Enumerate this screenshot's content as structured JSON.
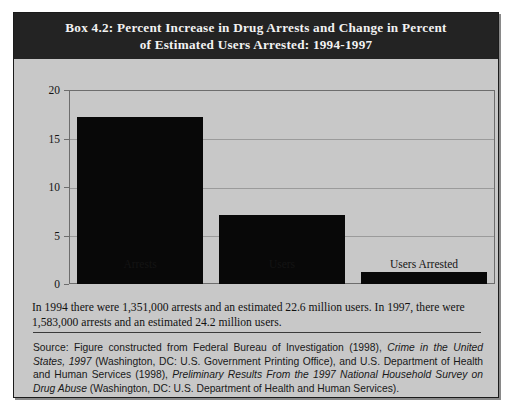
{
  "box": {
    "title_line1": "Box 4.2: Percent Increase in Drug Arrests and Change in Percent",
    "title_line2": "of Estimated Users Arrested: 1994-1997",
    "note": "In 1994 there were 1,351,000 arrests and an estimated 22.6 million users. In 1997, there were 1,583,000 arrests and an estimated 24.2 million users.",
    "source_prefix": "Source: Figure constructed from Federal Bureau of Investigation (1998), ",
    "source_title1": "Crime in the United States, 1997",
    "source_mid": " (Washington, DC: U.S. Government Printing Office), and U.S. Department of Health and Human Services (1998), ",
    "source_title2": "Preliminary Results From the 1997 National Household Survey on Drug Abuse",
    "source_suffix": " (Washington, DC: U.S. Department of Health and Human Services)."
  },
  "chart_data": {
    "type": "bar",
    "title": "Box 4.2: Percent Increase in Drug Arrests and Change in Percent of Estimated Users Arrested: 1994-1997",
    "categories": [
      "Arrests",
      "Users",
      "Users Arrested"
    ],
    "values": [
      17.2,
      7.1,
      1.2
    ],
    "xlabel": "",
    "ylabel": "",
    "ylim": [
      0,
      20
    ],
    "yticks": [
      0,
      5,
      10,
      15,
      20
    ],
    "ytick_labels": [
      "0",
      "5",
      "10",
      "15",
      "20"
    ],
    "grid": true,
    "legend": "none",
    "bar_color": "#080808",
    "plot_background": "#c8c8c8"
  },
  "colors": {
    "banner_background": "#232323",
    "banner_text": "#f2f2f2",
    "panel_background": "#c8c8c8",
    "frame_border": "#1b1b1b",
    "gridline": "#9b9b9b"
  }
}
